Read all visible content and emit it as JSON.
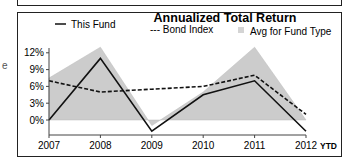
{
  "chart_data": {
    "type": "line",
    "title": "Annualized Total Return",
    "xlabel": "",
    "ylabel": "",
    "categories": [
      "2007",
      "2008",
      "2009",
      "2010",
      "2011",
      "2012"
    ],
    "x_suffix_last": "YTD",
    "yticks": [
      "12%",
      "9%",
      "6%",
      "3%",
      "0%"
    ],
    "ytick_values": [
      12,
      9,
      6,
      3,
      0
    ],
    "ylim": [
      -2,
      13
    ],
    "grid": false,
    "legend_position": "top",
    "series": [
      {
        "name": "This Fund",
        "style": "solid",
        "color": "#111111",
        "values": [
          0,
          11,
          -2,
          4.5,
          7,
          -2
        ]
      },
      {
        "name": "Bond Index",
        "style": "dashed",
        "color": "#111111",
        "values": [
          7,
          5,
          5.5,
          6,
          8,
          1
        ]
      },
      {
        "name": "Avg for Fund Type",
        "style": "area",
        "color": "#cccccc",
        "values": [
          7.5,
          13,
          -1,
          5,
          13,
          0
        ]
      }
    ]
  },
  "legend": {
    "this_fund": "This Fund",
    "bond_index": "--- Bond Index",
    "avg_fund_type": "Avg for Fund Type"
  },
  "edge_fragment": "e"
}
